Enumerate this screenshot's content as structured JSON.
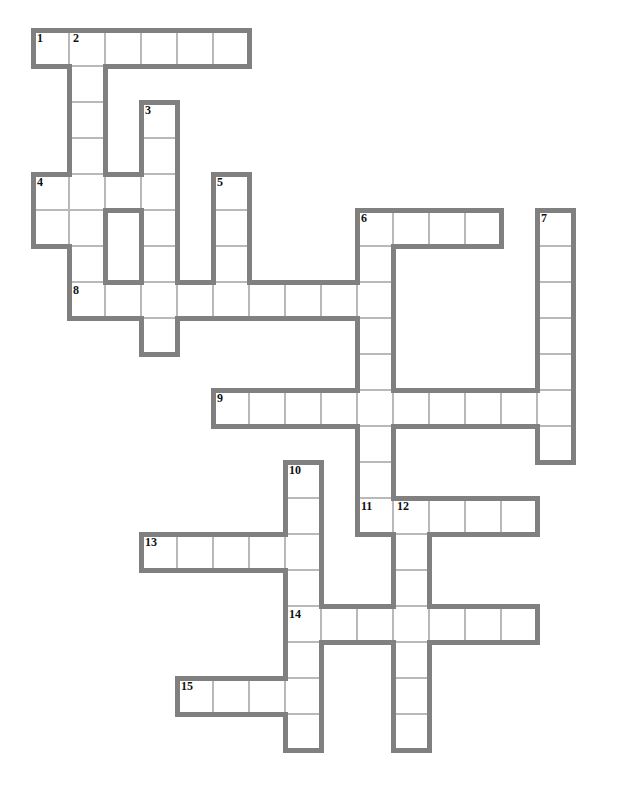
{
  "puzzle": {
    "title": "Crossword Grid",
    "kind": "crossword",
    "grid": {
      "cell_size": 36,
      "origin_x": 33,
      "origin_y": 30,
      "columns": 16,
      "rows": 21,
      "cell_fill": "#ffffff",
      "thin_rule_color": "#b9b9b9",
      "thick_border_color": "#808080",
      "thick_border_width": 5,
      "background": "#ffffff",
      "number_color": "#111111"
    },
    "entry_count": 15,
    "cells": [
      {
        "c": 0,
        "r": 0,
        "n": "1"
      },
      {
        "c": 1,
        "r": 0,
        "n": "2"
      },
      {
        "c": 2,
        "r": 0,
        "n": ""
      },
      {
        "c": 3,
        "r": 0,
        "n": ""
      },
      {
        "c": 4,
        "r": 0,
        "n": ""
      },
      {
        "c": 5,
        "r": 0,
        "n": ""
      },
      {
        "c": 1,
        "r": 1,
        "n": ""
      },
      {
        "c": 1,
        "r": 2,
        "n": ""
      },
      {
        "c": 3,
        "r": 2,
        "n": "3"
      },
      {
        "c": 1,
        "r": 3,
        "n": ""
      },
      {
        "c": 3,
        "r": 3,
        "n": ""
      },
      {
        "c": 0,
        "r": 4,
        "n": "4"
      },
      {
        "c": 1,
        "r": 4,
        "n": ""
      },
      {
        "c": 2,
        "r": 4,
        "n": ""
      },
      {
        "c": 3,
        "r": 4,
        "n": ""
      },
      {
        "c": 5,
        "r": 4,
        "n": "5"
      },
      {
        "c": 0,
        "r": 5,
        "n": ""
      },
      {
        "c": 1,
        "r": 5,
        "n": ""
      },
      {
        "c": 3,
        "r": 5,
        "n": ""
      },
      {
        "c": 5,
        "r": 5,
        "n": ""
      },
      {
        "c": 9,
        "r": 5,
        "n": "6"
      },
      {
        "c": 10,
        "r": 5,
        "n": ""
      },
      {
        "c": 11,
        "r": 5,
        "n": ""
      },
      {
        "c": 12,
        "r": 5,
        "n": ""
      },
      {
        "c": 14,
        "r": 5,
        "n": "7"
      },
      {
        "c": 1,
        "r": 6,
        "n": ""
      },
      {
        "c": 3,
        "r": 6,
        "n": ""
      },
      {
        "c": 5,
        "r": 6,
        "n": ""
      },
      {
        "c": 9,
        "r": 6,
        "n": ""
      },
      {
        "c": 14,
        "r": 6,
        "n": ""
      },
      {
        "c": 1,
        "r": 7,
        "n": "8"
      },
      {
        "c": 2,
        "r": 7,
        "n": ""
      },
      {
        "c": 3,
        "r": 7,
        "n": ""
      },
      {
        "c": 4,
        "r": 7,
        "n": ""
      },
      {
        "c": 5,
        "r": 7,
        "n": ""
      },
      {
        "c": 6,
        "r": 7,
        "n": ""
      },
      {
        "c": 7,
        "r": 7,
        "n": ""
      },
      {
        "c": 8,
        "r": 7,
        "n": ""
      },
      {
        "c": 9,
        "r": 7,
        "n": ""
      },
      {
        "c": 14,
        "r": 7,
        "n": ""
      },
      {
        "c": 3,
        "r": 8,
        "n": ""
      },
      {
        "c": 9,
        "r": 8,
        "n": ""
      },
      {
        "c": 14,
        "r": 8,
        "n": ""
      },
      {
        "c": 9,
        "r": 9,
        "n": ""
      },
      {
        "c": 14,
        "r": 9,
        "n": ""
      },
      {
        "c": 5,
        "r": 10,
        "n": "9"
      },
      {
        "c": 6,
        "r": 10,
        "n": ""
      },
      {
        "c": 7,
        "r": 10,
        "n": ""
      },
      {
        "c": 8,
        "r": 10,
        "n": ""
      },
      {
        "c": 9,
        "r": 10,
        "n": ""
      },
      {
        "c": 10,
        "r": 10,
        "n": ""
      },
      {
        "c": 11,
        "r": 10,
        "n": ""
      },
      {
        "c": 12,
        "r": 10,
        "n": ""
      },
      {
        "c": 13,
        "r": 10,
        "n": ""
      },
      {
        "c": 14,
        "r": 10,
        "n": ""
      },
      {
        "c": 9,
        "r": 11,
        "n": ""
      },
      {
        "c": 14,
        "r": 11,
        "n": ""
      },
      {
        "c": 7,
        "r": 12,
        "n": "10"
      },
      {
        "c": 9,
        "r": 12,
        "n": ""
      },
      {
        "c": 7,
        "r": 13,
        "n": ""
      },
      {
        "c": 9,
        "r": 13,
        "n": "11"
      },
      {
        "c": 10,
        "r": 13,
        "n": "12"
      },
      {
        "c": 11,
        "r": 13,
        "n": ""
      },
      {
        "c": 12,
        "r": 13,
        "n": ""
      },
      {
        "c": 13,
        "r": 13,
        "n": ""
      },
      {
        "c": 3,
        "r": 14,
        "n": "13"
      },
      {
        "c": 4,
        "r": 14,
        "n": ""
      },
      {
        "c": 5,
        "r": 14,
        "n": ""
      },
      {
        "c": 6,
        "r": 14,
        "n": ""
      },
      {
        "c": 7,
        "r": 14,
        "n": ""
      },
      {
        "c": 10,
        "r": 14,
        "n": ""
      },
      {
        "c": 7,
        "r": 15,
        "n": ""
      },
      {
        "c": 10,
        "r": 15,
        "n": ""
      },
      {
        "c": 7,
        "r": 16,
        "n": "14"
      },
      {
        "c": 8,
        "r": 16,
        "n": ""
      },
      {
        "c": 9,
        "r": 16,
        "n": ""
      },
      {
        "c": 10,
        "r": 16,
        "n": ""
      },
      {
        "c": 11,
        "r": 16,
        "n": ""
      },
      {
        "c": 12,
        "r": 16,
        "n": ""
      },
      {
        "c": 13,
        "r": 16,
        "n": ""
      },
      {
        "c": 7,
        "r": 17,
        "n": ""
      },
      {
        "c": 10,
        "r": 17,
        "n": ""
      },
      {
        "c": 4,
        "r": 18,
        "n": "15"
      },
      {
        "c": 5,
        "r": 18,
        "n": ""
      },
      {
        "c": 6,
        "r": 18,
        "n": ""
      },
      {
        "c": 7,
        "r": 18,
        "n": ""
      },
      {
        "c": 10,
        "r": 18,
        "n": ""
      },
      {
        "c": 7,
        "r": 19,
        "n": ""
      },
      {
        "c": 10,
        "r": 19,
        "n": ""
      }
    ]
  }
}
